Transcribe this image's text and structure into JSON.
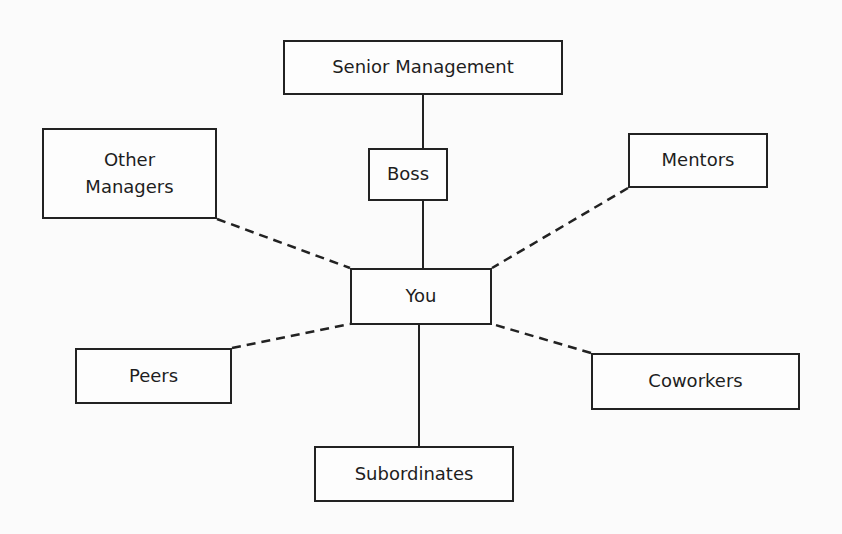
{
  "diagram": {
    "type": "relationship-network",
    "center": "You",
    "nodes": [
      {
        "id": "senior",
        "label": "Senior Management",
        "x": 283,
        "y": 40,
        "w": 280,
        "h": 55
      },
      {
        "id": "boss",
        "label": "Boss",
        "x": 368,
        "y": 148,
        "w": 80,
        "h": 53
      },
      {
        "id": "other",
        "label": "Other\nManagers",
        "x": 42,
        "y": 128,
        "w": 175,
        "h": 91
      },
      {
        "id": "mentors",
        "label": "Mentors",
        "x": 628,
        "y": 133,
        "w": 140,
        "h": 55
      },
      {
        "id": "you",
        "label": "You",
        "x": 350,
        "y": 268,
        "w": 142,
        "h": 57
      },
      {
        "id": "peers",
        "label": "Peers",
        "x": 75,
        "y": 348,
        "w": 157,
        "h": 56
      },
      {
        "id": "coworkers",
        "label": "Coworkers",
        "x": 591,
        "y": 353,
        "w": 209,
        "h": 57
      },
      {
        "id": "subordinates",
        "label": "Subordinates",
        "x": 314,
        "y": 446,
        "w": 200,
        "h": 56
      }
    ],
    "edges": [
      {
        "from": "senior",
        "to": "boss",
        "style": "solid",
        "x1": 423,
        "y1": 95,
        "x2": 423,
        "y2": 148
      },
      {
        "from": "boss",
        "to": "you",
        "style": "solid",
        "x1": 423,
        "y1": 201,
        "x2": 423,
        "y2": 268
      },
      {
        "from": "you",
        "to": "subordinates",
        "style": "solid",
        "x1": 419,
        "y1": 325,
        "x2": 419,
        "y2": 446
      },
      {
        "from": "other",
        "to": "you",
        "style": "dashed",
        "x1": 217,
        "y1": 219,
        "x2": 350,
        "y2": 268
      },
      {
        "from": "mentors",
        "to": "you",
        "style": "dashed",
        "x1": 628,
        "y1": 188,
        "x2": 492,
        "y2": 268
      },
      {
        "from": "peers",
        "to": "you",
        "style": "dashed",
        "x1": 232,
        "y1": 348,
        "x2": 350,
        "y2": 324
      },
      {
        "from": "coworkers",
        "to": "you",
        "style": "dashed",
        "x1": 591,
        "y1": 353,
        "x2": 492,
        "y2": 324
      }
    ]
  },
  "colors": {
    "line": "#222222",
    "text": "#1e1e1e",
    "background": "#fbfbfb"
  }
}
